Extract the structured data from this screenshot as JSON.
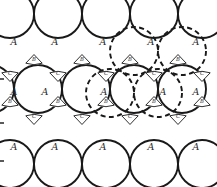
{
  "figure": {
    "background_color": "#ffffff",
    "line_color": "#1a1a1a",
    "label_color": "#2b2b2b",
    "width": 217,
    "height": 187
  },
  "legend": {
    "sphere_label": "A",
    "interstice_up_label": "B",
    "interstice_down_label": "C"
  },
  "chart_data": {
    "type": "diagram",
    "sphere_radius": 24,
    "row_spacing": 42,
    "column_spacing": 48,
    "spheres": [
      {
        "cx": 10,
        "cy": 14,
        "label": "A",
        "label_x": 14,
        "label_y": 45,
        "style": "solid"
      },
      {
        "cx": 58,
        "cy": 14,
        "label": "A",
        "label_x": 55,
        "label_y": 45,
        "style": "solid"
      },
      {
        "cx": 106,
        "cy": 14,
        "label": "A",
        "label_x": 103,
        "label_y": 45,
        "style": "solid"
      },
      {
        "cx": 154,
        "cy": 14,
        "label": "A",
        "label_x": 151,
        "label_y": 45,
        "style": "solid"
      },
      {
        "cx": 202,
        "cy": 14,
        "label": "A",
        "label_x": 196,
        "label_y": 45,
        "style": "solid"
      },
      {
        "cx": 38,
        "cy": 89,
        "label": "A",
        "label_x": 45,
        "label_y": 95,
        "style": "solid"
      },
      {
        "cx": 86,
        "cy": 89,
        "label": "A",
        "label_x": 104,
        "label_y": 95,
        "style": "solid"
      },
      {
        "cx": 134,
        "cy": 89,
        "label": "A",
        "label_x": 163,
        "label_y": 95,
        "style": "solid"
      },
      {
        "cx": 182,
        "cy": 89,
        "label": "A",
        "label_x": 196,
        "label_y": 95,
        "style": "solid"
      },
      {
        "cx": -10,
        "cy": 89,
        "label": "A",
        "label_x": 14,
        "label_y": 95,
        "style": "solid"
      },
      {
        "cx": 10,
        "cy": 164,
        "label": "A",
        "label_x": 14,
        "label_y": 150,
        "style": "solid"
      },
      {
        "cx": 58,
        "cy": 164,
        "label": "A",
        "label_x": 55,
        "label_y": 150,
        "style": "solid"
      },
      {
        "cx": 106,
        "cy": 164,
        "label": "A",
        "label_x": 103,
        "label_y": 150,
        "style": "solid"
      },
      {
        "cx": 154,
        "cy": 164,
        "label": "A",
        "label_x": 151,
        "label_y": 150,
        "style": "solid"
      },
      {
        "cx": 202,
        "cy": 164,
        "label": "A",
        "label_x": 196,
        "label_y": 150,
        "style": "solid"
      }
    ],
    "ghost_spheres": [
      {
        "cx": 134,
        "cy": 51,
        "style": "dashed"
      },
      {
        "cx": 182,
        "cy": 51,
        "style": "dashed"
      },
      {
        "cx": 110,
        "cy": 93,
        "style": "dashed"
      },
      {
        "cx": 158,
        "cy": 93,
        "style": "dashed"
      }
    ],
    "interstices": [
      {
        "cx": 34,
        "cy": 60,
        "label": "B",
        "orientation": "up"
      },
      {
        "cx": 82,
        "cy": 60,
        "label": "B",
        "orientation": "up"
      },
      {
        "cx": 130,
        "cy": 60,
        "label": "B",
        "orientation": "up"
      },
      {
        "cx": 178,
        "cy": 60,
        "label": "B",
        "orientation": "up"
      },
      {
        "cx": 10,
        "cy": 76,
        "label": "C",
        "orientation": "down"
      },
      {
        "cx": 58,
        "cy": 76,
        "label": "C",
        "orientation": "down"
      },
      {
        "cx": 106,
        "cy": 76,
        "label": "C",
        "orientation": "down"
      },
      {
        "cx": 154,
        "cy": 76,
        "label": "C",
        "orientation": "down"
      },
      {
        "cx": 202,
        "cy": 76,
        "label": "C",
        "orientation": "down"
      },
      {
        "cx": 10,
        "cy": 102,
        "label": "B",
        "orientation": "up"
      },
      {
        "cx": 58,
        "cy": 102,
        "label": "B",
        "orientation": "up"
      },
      {
        "cx": 106,
        "cy": 102,
        "label": "B",
        "orientation": "up"
      },
      {
        "cx": 154,
        "cy": 102,
        "label": "B",
        "orientation": "up"
      },
      {
        "cx": 202,
        "cy": 102,
        "label": "B",
        "orientation": "up"
      },
      {
        "cx": 34,
        "cy": 119,
        "label": "C",
        "orientation": "down"
      },
      {
        "cx": 82,
        "cy": 119,
        "label": "C",
        "orientation": "down"
      },
      {
        "cx": 130,
        "cy": 119,
        "label": "C",
        "orientation": "down"
      },
      {
        "cx": 178,
        "cy": 119,
        "label": "C",
        "orientation": "down"
      }
    ],
    "edge_ticks": [
      {
        "x": 0,
        "y": 78,
        "w": 4,
        "h": 2
      },
      {
        "x": 0,
        "y": 122,
        "w": 4,
        "h": 2
      },
      {
        "x": 0,
        "y": 160,
        "w": 4,
        "h": 2
      }
    ]
  }
}
